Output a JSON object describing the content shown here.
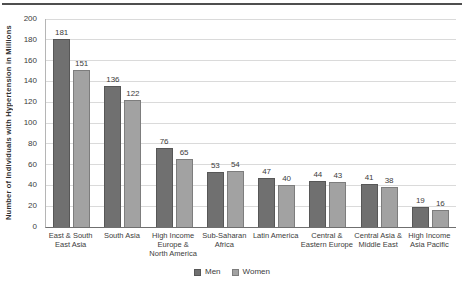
{
  "page": {
    "background": "#ffffff",
    "top_rule_color": "#4f4f4f"
  },
  "chart_data": {
    "type": "bar",
    "title": "",
    "xlabel": "",
    "ylabel": "Number of Individuals with Hypertension in Millions",
    "ylim": [
      0,
      200
    ],
    "yticks": [
      0,
      20,
      40,
      60,
      80,
      100,
      120,
      140,
      160,
      180,
      200
    ],
    "grid": true,
    "legend_position": "bottom",
    "categories": [
      "East & South East Asia",
      "South Asia",
      "High Income Europe & North America",
      "Sub-Saharan Africa",
      "Latin America",
      "Central & Eastern Europe",
      "Central Asia & Middle East",
      "High Income Asia Pacific"
    ],
    "category_lines": [
      [
        "East & South",
        "East Asia"
      ],
      [
        "South Asia"
      ],
      [
        "High Income",
        "Europe &",
        "North America"
      ],
      [
        "Sub-Saharan",
        "Africa"
      ],
      [
        "Latin America"
      ],
      [
        "Central &",
        "Eastern Europe"
      ],
      [
        "Central Asia &",
        "Middle East"
      ],
      [
        "High Income",
        "Asia Pacific"
      ]
    ],
    "series": [
      {
        "name": "Men",
        "color": "#707070",
        "border_color": "#575757",
        "values": [
          181,
          136,
          76,
          53,
          47,
          44,
          41,
          19
        ]
      },
      {
        "name": "Women",
        "color": "#a2a2a2",
        "border_color": "#7d7d7d",
        "values": [
          151,
          122,
          65,
          54,
          40,
          43,
          38,
          16
        ]
      }
    ],
    "colors": {
      "gridline": "#dadada",
      "x_axis_line": "#6f6f6f",
      "y_axis_line": "#b5b5b5",
      "text": "#3c3c3c"
    }
  }
}
